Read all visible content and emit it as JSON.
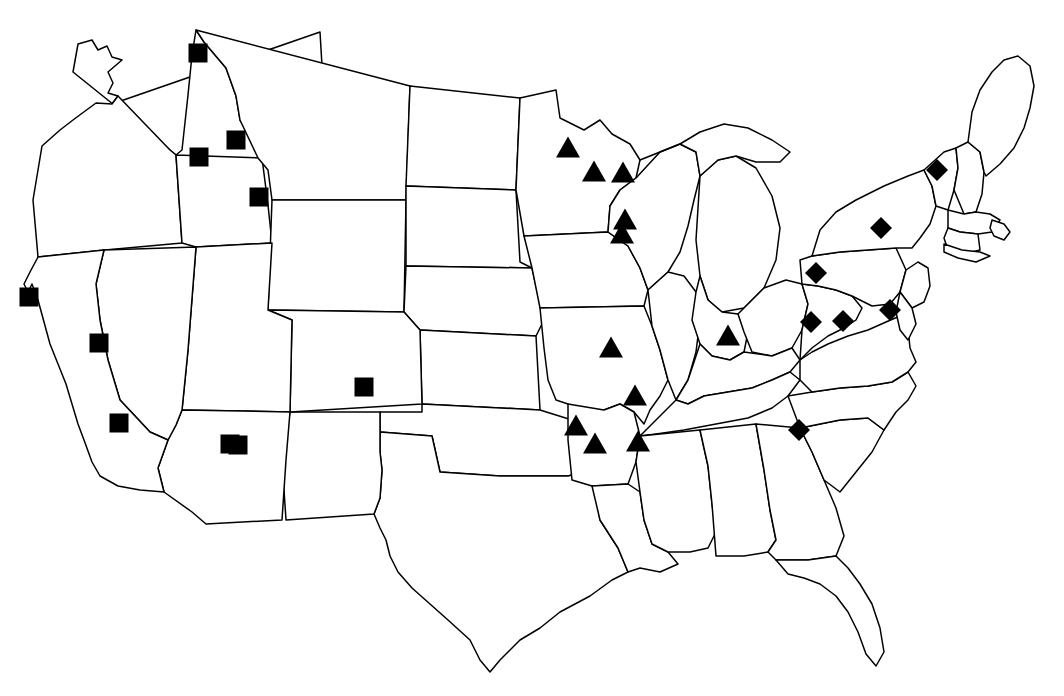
{
  "figure": {
    "title": "United States state outline map with site markers",
    "width": 1064,
    "height": 696,
    "background_color": "#FFFFFF",
    "outline_color": "#000000",
    "marker_color": "#000000"
  },
  "chart_data": {
    "type": "scatter",
    "title": "United States state outline map with site markers",
    "subtitle": "",
    "xlabel": "",
    "ylabel": "",
    "projection": "conterminous United States, state boundaries outlined in black on white",
    "grid": false,
    "legend_visible": false,
    "legend_position": "none",
    "xlim": [
      0,
      1064
    ],
    "ylim": [
      0,
      696
    ],
    "marker_size_px": {
      "square": 19,
      "triangle_width": 24,
      "triangle_height": 21,
      "diamond": 22
    },
    "series": [
      {
        "name": "square-sites",
        "symbol": "square",
        "color": "#000000",
        "count": 10,
        "points": [
          {
            "x": 198,
            "y": 53,
            "region": "Montana-Idaho border north"
          },
          {
            "x": 236,
            "y": 140,
            "region": "Idaho-Montana southwest"
          },
          {
            "x": 199,
            "y": 157,
            "region": "eastern Oregon / Idaho border"
          },
          {
            "x": 259,
            "y": 197,
            "region": "southeast Idaho"
          },
          {
            "x": 29,
            "y": 297,
            "region": "northern California coast"
          },
          {
            "x": 99,
            "y": 343,
            "region": "western Nevada"
          },
          {
            "x": 119,
            "y": 423,
            "region": "southern California"
          },
          {
            "x": 238,
            "y": 445,
            "region": "New Mexico"
          },
          {
            "x": 364,
            "y": 387,
            "region": "Kansas-Colorado border"
          },
          {
            "x": 230,
            "y": 444,
            "region": "central New Mexico"
          }
        ]
      },
      {
        "name": "triangle-sites",
        "symbol": "triangle",
        "color": "#000000",
        "count": 11,
        "points": [
          {
            "x": 568,
            "y": 147,
            "region": "central Minnesota"
          },
          {
            "x": 594,
            "y": 171,
            "region": "east central Minnesota"
          },
          {
            "x": 623,
            "y": 172,
            "region": "western Wisconsin"
          },
          {
            "x": 625,
            "y": 219,
            "region": "northeast Iowa"
          },
          {
            "x": 622,
            "y": 233,
            "region": "northeast Iowa lower"
          },
          {
            "x": 611,
            "y": 347,
            "region": "central Missouri"
          },
          {
            "x": 635,
            "y": 395,
            "region": "southeast Missouri"
          },
          {
            "x": 576,
            "y": 425,
            "region": "northwest Arkansas"
          },
          {
            "x": 595,
            "y": 443,
            "region": "west central Arkansas"
          },
          {
            "x": 728,
            "y": 335,
            "region": "southern Indiana"
          },
          {
            "x": 638,
            "y": 441,
            "region": "northeast Mississippi"
          }
        ]
      },
      {
        "name": "diamond-sites",
        "symbol": "diamond",
        "color": "#000000",
        "count": 6,
        "points": [
          {
            "x": 937,
            "y": 170,
            "region": "Vermont"
          },
          {
            "x": 881,
            "y": 228,
            "region": "central New York"
          },
          {
            "x": 816,
            "y": 273,
            "region": "northwest Pennsylvania"
          },
          {
            "x": 811,
            "y": 322,
            "region": "southern Ohio / West Virginia"
          },
          {
            "x": 843,
            "y": 321,
            "region": "West Virginia"
          },
          {
            "x": 890,
            "y": 310,
            "region": "Maryland / northern Virginia"
          },
          {
            "x": 799,
            "y": 430,
            "region": "upstate South Carolina"
          }
        ]
      }
    ]
  },
  "legend": {
    "visible": false,
    "entries": [
      {
        "symbol": "square",
        "label": ""
      },
      {
        "symbol": "triangle",
        "label": ""
      },
      {
        "symbol": "diamond",
        "label": ""
      }
    ]
  }
}
